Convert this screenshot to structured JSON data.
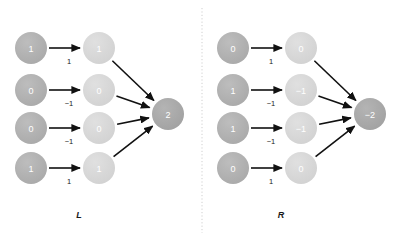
{
  "figure": {
    "background": "#ffffff",
    "divider": {
      "name": "vertical-dotted-divider",
      "x": 202,
      "y1": 8,
      "y2": 233,
      "color": "#cfcfcf"
    }
  },
  "colors": {
    "input_node": "#b0b0b0",
    "hidden_node": "#d8d8d8",
    "output_node": "#a8a8a8",
    "node_label": "#ffffff",
    "edge": "#111111",
    "weight_label": "#1a1a1a",
    "panel_label": "#1a1a1a",
    "divider": "#cfcfcf"
  },
  "geometry": {
    "input_x": 31,
    "hidden_x": 99,
    "output_x": 168,
    "output_x_right": 370,
    "panel_offset_right": 202,
    "row_y": [
      48,
      90,
      128,
      168
    ],
    "output_y": 114,
    "node_r": 16,
    "output_r": 16,
    "label_y": 215
  },
  "panels": [
    {
      "id": "left",
      "label": "L",
      "label_name": "panel-label-left",
      "output": {
        "value": "2",
        "name": "output-node-left"
      },
      "rows": [
        {
          "input": "1",
          "weight": "1",
          "hidden": "1"
        },
        {
          "input": "0",
          "weight": "−1",
          "hidden": "0"
        },
        {
          "input": "0",
          "weight": "−1",
          "hidden": "0"
        },
        {
          "input": "1",
          "weight": "1",
          "hidden": "1"
        }
      ]
    },
    {
      "id": "right",
      "label": "R",
      "label_name": "panel-label-right",
      "output": {
        "value": "−2",
        "name": "output-node-right"
      },
      "rows": [
        {
          "input": "0",
          "weight": "1",
          "hidden": "0"
        },
        {
          "input": "1",
          "weight": "−1",
          "hidden": "−1"
        },
        {
          "input": "1",
          "weight": "−1",
          "hidden": "−1"
        },
        {
          "input": "0",
          "weight": "1",
          "hidden": "0"
        }
      ]
    }
  ],
  "chart_data": {
    "type": "diagram",
    "title": "",
    "graphs": [
      {
        "name": "L",
        "inputs": [
          1,
          0,
          0,
          1
        ],
        "weights": [
          1,
          -1,
          -1,
          1
        ],
        "hidden": [
          1,
          0,
          0,
          1
        ],
        "output": 2
      },
      {
        "name": "R",
        "inputs": [
          0,
          1,
          1,
          0
        ],
        "weights": [
          1,
          -1,
          -1,
          1
        ],
        "hidden": [
          0,
          -1,
          -1,
          0
        ],
        "output": -2
      }
    ]
  }
}
